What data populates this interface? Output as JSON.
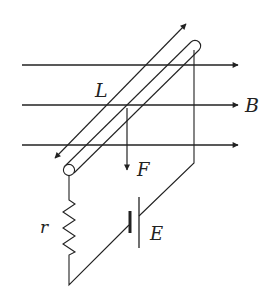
{
  "diagram": {
    "labels": {
      "length": "L",
      "field": "B",
      "force": "F",
      "resistance": "r",
      "emf": "E"
    },
    "colors": {
      "stroke": "#222222",
      "background": "#ffffff"
    },
    "field_lines": [
      {
        "y": 65
      },
      {
        "y": 105
      },
      {
        "y": 145
      }
    ]
  }
}
